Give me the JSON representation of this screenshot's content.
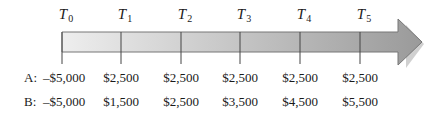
{
  "periods": [
    {
      "letter": "T",
      "sub": "0",
      "x": 62
    },
    {
      "letter": "T",
      "sub": "1",
      "x": 121
    },
    {
      "letter": "T",
      "sub": "2",
      "x": 181
    },
    {
      "letter": "T",
      "sub": "3",
      "x": 240
    },
    {
      "letter": "T",
      "sub": "4",
      "x": 300
    },
    {
      "letter": "T",
      "sub": "5",
      "x": 360
    }
  ],
  "rows": [
    {
      "label": "A:",
      "values": [
        "–$5,000",
        "$2,500",
        "$2,500",
        "$2,500",
        "$2,500",
        "$2,500"
      ]
    },
    {
      "label": "B:",
      "values": [
        "–$5,000",
        "$1,500",
        "$2,500",
        "$3,500",
        "$4,500",
        "$5,500"
      ]
    }
  ],
  "colors": {
    "arrow_light": "#eeeeee",
    "arrow_dark": "#999999",
    "tick": "#444444"
  }
}
